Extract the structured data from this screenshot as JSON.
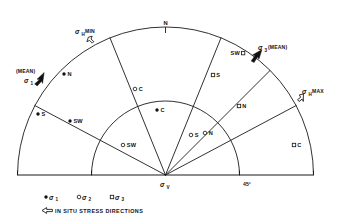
{
  "figure": {
    "title_symbols": {
      "sigma": "σ",
      "degree": "°"
    },
    "origin_label": {
      "base": "σ",
      "sub": "V"
    },
    "north_label": "N",
    "angle_label": "45°",
    "annotations": [
      {
        "id": "sigma-h-min",
        "base": "σ",
        "sub": "H",
        "suffix": "MIN",
        "x": 78,
        "y": 32
      },
      {
        "id": "sigma-1-mean",
        "base": "σ",
        "sub": "1",
        "suffix": "",
        "prefix": "(MEAN)",
        "x": 18,
        "y": 80
      },
      {
        "id": "sigma-3-mean",
        "base": "σ",
        "sub": "3",
        "suffix": "(MEAN)",
        "x": 258,
        "y": 48
      },
      {
        "id": "sigma-h-max",
        "base": "σ",
        "sub": "H",
        "suffix": "MAX",
        "x": 303,
        "y": 91
      }
    ],
    "points": [
      {
        "id": "p-sigma1-n",
        "type": "filled",
        "label": "N",
        "x": 64,
        "y": 74
      },
      {
        "id": "p-sigma1-s",
        "type": "filled",
        "label": "S",
        "x": 38,
        "y": 114
      },
      {
        "id": "p-sigma1-sw",
        "type": "filled",
        "label": "SW",
        "x": 70,
        "y": 121
      },
      {
        "id": "p-sigma1-c",
        "type": "filled",
        "label": "C",
        "x": 157,
        "y": 110
      },
      {
        "id": "p-sigma2-c",
        "type": "open",
        "label": "C",
        "x": 135,
        "y": 89
      },
      {
        "id": "p-sigma2-sw",
        "type": "open",
        "label": "SW",
        "x": 123,
        "y": 145
      },
      {
        "id": "p-sigma2-s",
        "type": "open",
        "label": "S",
        "x": 191,
        "y": 135
      },
      {
        "id": "p-sigma2-n",
        "type": "open",
        "label": "N",
        "x": 205,
        "y": 133
      },
      {
        "id": "p-sigma3-sw",
        "type": "square",
        "label": "SW",
        "x": 243,
        "y": 53,
        "label_side": "left"
      },
      {
        "id": "p-sigma3-s",
        "type": "square",
        "label": "S",
        "x": 213,
        "y": 75
      },
      {
        "id": "p-sigma3-n",
        "type": "square",
        "label": "N",
        "x": 239,
        "y": 106
      },
      {
        "id": "p-sigma3-c",
        "type": "square",
        "label": "C",
        "x": 294,
        "y": 145
      }
    ],
    "legend": {
      "items": [
        {
          "id": "legend-sigma1",
          "type": "filled",
          "base": "σ",
          "sub": "1"
        },
        {
          "id": "legend-sigma2",
          "type": "open",
          "base": "σ",
          "sub": "2"
        },
        {
          "id": "legend-sigma3",
          "type": "square",
          "base": "σ",
          "sub": "3"
        }
      ],
      "stress_directions_text": "IN SITU STRESS DIRECTIONS"
    },
    "colors": {
      "line": "#1a1a1a",
      "fill": "#111111",
      "background": "#ffffff"
    }
  }
}
